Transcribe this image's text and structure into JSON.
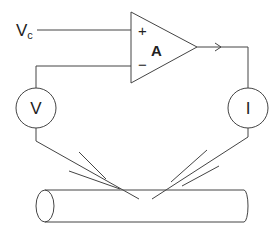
{
  "diagram": {
    "input_label": "V",
    "input_subscript": "c",
    "amplifier": {
      "label": "A",
      "plus": "+",
      "minus": "−"
    },
    "voltmeter": {
      "label": "V"
    },
    "ammeter": {
      "label": "I"
    }
  },
  "colors": {
    "line": "#444444",
    "background": "#ffffff"
  }
}
